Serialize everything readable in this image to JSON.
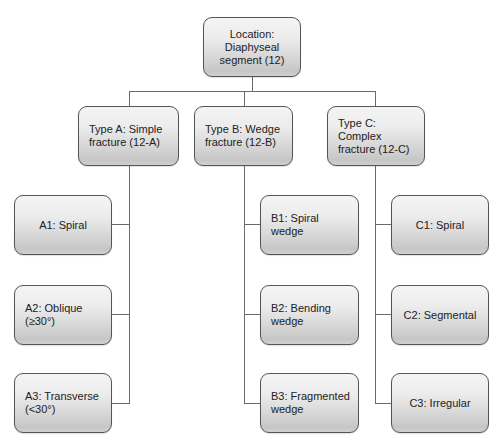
{
  "diagram": {
    "root": {
      "label": "Location:\nDiaphyseal\nsegment (12)"
    },
    "types": [
      {
        "label": "Type A: Simple\nfracture (12-A)",
        "children": [
          {
            "label": "A1: Spiral"
          },
          {
            "label": "A2: Oblique\n(≥30°)"
          },
          {
            "label": "A3: Transverse\n(<30°)"
          }
        ]
      },
      {
        "label": "Type B: Wedge\nfracture (12-B)",
        "children": [
          {
            "label": "B1: Spiral wedge"
          },
          {
            "label": "B2: Bending\nwedge"
          },
          {
            "label": "B3: Fragmented\nwedge"
          }
        ]
      },
      {
        "label": "Type C: Complex\nfracture (12-C)",
        "children": [
          {
            "label": "C1: Spiral"
          },
          {
            "label": "C2: Segmental"
          },
          {
            "label": "C3: Irregular"
          }
        ]
      }
    ],
    "colors": {
      "box_border": "#555555",
      "box_gradient_top": "#f4f4f4",
      "box_gradient_bottom": "#c6c6c6",
      "connector": "#6a6a6a",
      "text": "#222222"
    }
  }
}
